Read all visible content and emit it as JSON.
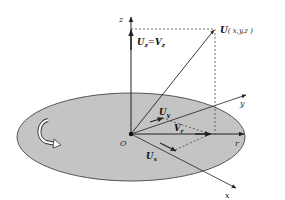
{
  "diagram": {
    "type": "3d-velocity-decomposition",
    "colors": {
      "disk_fill": "#c4c4c4",
      "disk_stroke": "#555555",
      "line": "#222222",
      "background": "#ffffff"
    },
    "axes": {
      "z": "z",
      "y": "y",
      "r": "r",
      "x": "x",
      "origin": "O"
    },
    "vectors": {
      "point_label_main": "U",
      "point_label_coords": "( x,y,z )",
      "uz_lhs": "U",
      "uz_lhs_sub": "z",
      "uz_eq": "=",
      "uz_rhs": "V",
      "uz_rhs_sub": "z",
      "uy": "U",
      "uy_sub": "y",
      "vr": "V",
      "vr_sub": "r",
      "ux": "U",
      "ux_sub": "x"
    },
    "rotation_icon": "curved-rotation-arrow"
  }
}
